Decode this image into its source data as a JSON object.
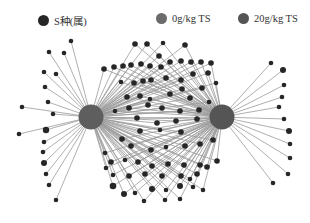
{
  "legend": {
    "items": [
      {
        "label": "S种(属)",
        "color": "#262626",
        "x": 38
      },
      {
        "label": "0g/kg TS",
        "color": "#6b6b6b",
        "x": 156
      },
      {
        "label": "20g/kg TS",
        "color": "#555555",
        "x": 238
      }
    ]
  },
  "network": {
    "edge_color": "#9a9a9a",
    "node_color": "#262626",
    "hubs": [
      {
        "id": "0g",
        "label": "0g/kg TS",
        "x": 91,
        "y": 117,
        "r": 12.5,
        "color": "#5e5e5e"
      },
      {
        "id": "20g",
        "label": "20g/kg TS",
        "x": 222,
        "y": 117,
        "r": 12.5,
        "color": "#555555"
      }
    ],
    "left_only": [
      [
        71,
        41,
        2.3
      ],
      [
        49,
        52,
        2.3
      ],
      [
        64,
        53,
        2.3
      ],
      [
        44,
        72,
        2.3
      ],
      [
        56,
        74,
        2.3
      ],
      [
        45,
        87,
        2.3
      ],
      [
        48,
        102,
        2.3
      ],
      [
        22,
        107,
        2.3
      ],
      [
        53,
        114,
        2.3
      ],
      [
        19,
        134,
        2.3
      ],
      [
        46,
        130,
        3.2
      ],
      [
        44,
        142,
        2.3
      ],
      [
        43,
        152,
        2.3
      ],
      [
        44,
        163,
        3
      ],
      [
        46,
        174,
        2.3
      ],
      [
        49,
        185,
        2.3
      ],
      [
        56,
        200,
        2.3
      ]
    ],
    "right_only": [
      [
        271,
        63,
        2.3
      ],
      [
        283,
        70,
        3
      ],
      [
        284,
        85,
        2.3
      ],
      [
        282,
        97,
        2.3
      ],
      [
        279,
        107,
        2.3
      ],
      [
        284,
        119,
        2.3
      ],
      [
        289,
        131,
        3
      ],
      [
        290,
        144,
        2.3
      ],
      [
        290,
        158,
        2.3
      ],
      [
        288,
        174,
        2.3
      ],
      [
        273,
        183,
        2.3
      ]
    ],
    "shared": [
      [
        135,
        44,
        2.8
      ],
      [
        147,
        44,
        2.8
      ],
      [
        163,
        43,
        2.3
      ],
      [
        185,
        45,
        2.8
      ],
      [
        159,
        56,
        2.8
      ],
      [
        104,
        69,
        2.8
      ],
      [
        114,
        67,
        2.8
      ],
      [
        123,
        66,
        2.8
      ],
      [
        131,
        65,
        2.8
      ],
      [
        141,
        64,
        2.8
      ],
      [
        150,
        66,
        2.8
      ],
      [
        161,
        67,
        2.8
      ],
      [
        170,
        62,
        2.8
      ],
      [
        181,
        61,
        2.8
      ],
      [
        191,
        62,
        2.8
      ],
      [
        201,
        62,
        2.8
      ],
      [
        211,
        63,
        2.8
      ],
      [
        121,
        82,
        2.3
      ],
      [
        134,
        83,
        2.8
      ],
      [
        143,
        81,
        2.8
      ],
      [
        151,
        80,
        2.8
      ],
      [
        166,
        78,
        2.8
      ],
      [
        181,
        80,
        2.8
      ],
      [
        193,
        74,
        2.8
      ],
      [
        208,
        73,
        2.8
      ],
      [
        127,
        97,
        2.8
      ],
      [
        140,
        96,
        2.8
      ],
      [
        150,
        99,
        2.3
      ],
      [
        170,
        94,
        2.8
      ],
      [
        182,
        89,
        2.8
      ],
      [
        190,
        98,
        2.8
      ],
      [
        202,
        88,
        2.8
      ],
      [
        216,
        83,
        2.3
      ],
      [
        115,
        111,
        2.3
      ],
      [
        129,
        108,
        2.8
      ],
      [
        148,
        105,
        2.8
      ],
      [
        162,
        108,
        2.8
      ],
      [
        180,
        111,
        2.8
      ],
      [
        199,
        110,
        2.8
      ],
      [
        209,
        102,
        2.3
      ],
      [
        137,
        118,
        2.8
      ],
      [
        157,
        123,
        2.8
      ],
      [
        176,
        121,
        2.8
      ],
      [
        197,
        119,
        2.8
      ],
      [
        140,
        131,
        2.8
      ],
      [
        160,
        130,
        2.3
      ],
      [
        181,
        132,
        2.8
      ],
      [
        122,
        139,
        2.8
      ],
      [
        131,
        146,
        2.8
      ],
      [
        151,
        150,
        2.8
      ],
      [
        166,
        147,
        2.3
      ],
      [
        185,
        146,
        2.8
      ],
      [
        200,
        144,
        2.8
      ],
      [
        213,
        140,
        2.8
      ],
      [
        105,
        153,
        2.3
      ],
      [
        111,
        162,
        2.8
      ],
      [
        125,
        160,
        2.3
      ],
      [
        138,
        162,
        2.8
      ],
      [
        152,
        166,
        2.8
      ],
      [
        168,
        164,
        2.8
      ],
      [
        184,
        165,
        2.8
      ],
      [
        200,
        165,
        2.8
      ],
      [
        217,
        161,
        2.8
      ],
      [
        106,
        168,
        2.3
      ],
      [
        113,
        175,
        2.3
      ],
      [
        129,
        176,
        2.8
      ],
      [
        145,
        174,
        2.8
      ],
      [
        162,
        176,
        2.8
      ],
      [
        181,
        176,
        2.8
      ],
      [
        197,
        174,
        2.8
      ],
      [
        207,
        167,
        2.8
      ],
      [
        113,
        186,
        3.3
      ],
      [
        124,
        194,
        3
      ],
      [
        135,
        193,
        2.3
      ],
      [
        152,
        189,
        3
      ],
      [
        166,
        190,
        2.3
      ],
      [
        180,
        186,
        3
      ],
      [
        193,
        187,
        2.3
      ],
      [
        203,
        190,
        2.3
      ],
      [
        144,
        201,
        2.3
      ],
      [
        165,
        200,
        2.3
      ],
      [
        180,
        199,
        2.3
      ],
      [
        190,
        179,
        2.3
      ]
    ]
  },
  "caption": "图 · 样品与微生物种(属)网络"
}
